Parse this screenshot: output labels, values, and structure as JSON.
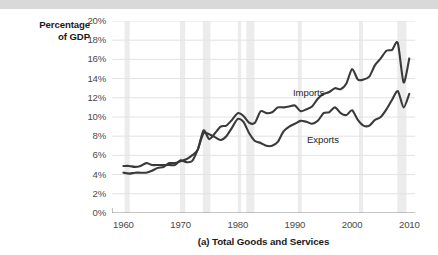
{
  "figure": {
    "caption": "(a) Total Goods and Services",
    "axis_title_line1": "Percentage",
    "axis_title_line2": "of GDP"
  },
  "colors": {
    "line": "#3a3a3a",
    "grid": "#e2e2e2",
    "recession_band": "#ececec",
    "axis": "#8a8a8a",
    "tick_text": "#4a4a4a",
    "title_text": "#1a1a1a",
    "top_strip": "#d9d9d9"
  },
  "chart_data": {
    "type": "line",
    "title": "(a) Total Goods and Services",
    "xlabel": "",
    "ylabel": "Percentage of GDP",
    "xlim": [
      1958,
      2011
    ],
    "ylim": [
      0,
      20
    ],
    "ytick_labels": [
      "20%",
      "18%",
      "16%",
      "14%",
      "12%",
      "10%",
      "8%",
      "6%",
      "4%",
      "2%",
      "0%"
    ],
    "ytick_values": [
      20,
      18,
      16,
      14,
      12,
      10,
      8,
      6,
      4,
      2,
      0
    ],
    "xtick_labels": [
      "1960",
      "1970",
      "1980",
      "1990",
      "2000",
      "2010"
    ],
    "xtick_values": [
      1960,
      1970,
      1980,
      1990,
      2000,
      2010
    ],
    "grid": true,
    "legend": "inline-labels",
    "recession_bands": [
      [
        1960.2,
        1961.1
      ],
      [
        1969.9,
        1970.8
      ],
      [
        1973.9,
        1975.2
      ],
      [
        1980.0,
        1980.6
      ],
      [
        1981.5,
        1982.9
      ],
      [
        1990.5,
        1991.2
      ],
      [
        2001.2,
        2001.9
      ],
      [
        2007.9,
        2009.5
      ]
    ],
    "series": [
      {
        "name": "Imports",
        "label": "Imports",
        "x": [
          1960,
          1961,
          1962,
          1963,
          1964,
          1965,
          1966,
          1967,
          1968,
          1969,
          1970,
          1971,
          1972,
          1973,
          1974,
          1975,
          1976,
          1977,
          1978,
          1979,
          1980,
          1981,
          1982,
          1983,
          1984,
          1985,
          1986,
          1987,
          1988,
          1989,
          1990,
          1991,
          1992,
          1993,
          1994,
          1995,
          1996,
          1997,
          1998,
          1999,
          2000,
          2001,
          2002,
          2003,
          2004,
          2005,
          2006,
          2007,
          2008,
          2009,
          2010
        ],
        "values": [
          4.2,
          4.1,
          4.2,
          4.2,
          4.2,
          4.4,
          4.7,
          4.8,
          5.2,
          5.2,
          5.4,
          5.6,
          6.0,
          6.6,
          8.6,
          7.7,
          8.3,
          9.0,
          9.1,
          9.7,
          10.4,
          10.1,
          9.4,
          9.4,
          10.6,
          10.4,
          10.5,
          11.0,
          11.0,
          11.1,
          11.2,
          10.6,
          10.8,
          11.1,
          11.9,
          12.4,
          12.6,
          13.0,
          12.9,
          13.5,
          15.0,
          13.9,
          13.9,
          14.2,
          15.4,
          16.1,
          16.9,
          17.0,
          17.7,
          13.6,
          16.1
        ]
      },
      {
        "name": "Exports",
        "label": "Exports",
        "x": [
          1960,
          1961,
          1962,
          1963,
          1964,
          1965,
          1966,
          1967,
          1968,
          1969,
          1970,
          1971,
          1972,
          1973,
          1974,
          1975,
          1976,
          1977,
          1978,
          1979,
          1980,
          1981,
          1982,
          1983,
          1984,
          1985,
          1986,
          1987,
          1988,
          1989,
          1990,
          1991,
          1992,
          1993,
          1994,
          1995,
          1996,
          1997,
          1998,
          1999,
          2000,
          2001,
          2002,
          2003,
          2004,
          2005,
          2006,
          2007,
          2008,
          2009,
          2010
        ],
        "values": [
          4.9,
          4.9,
          4.8,
          4.9,
          5.2,
          5.0,
          5.0,
          5.0,
          5.0,
          5.0,
          5.5,
          5.3,
          5.4,
          6.6,
          8.3,
          8.2,
          7.9,
          7.6,
          8.0,
          8.9,
          9.8,
          9.5,
          8.3,
          7.5,
          7.3,
          7.0,
          7.0,
          7.4,
          8.5,
          9.0,
          9.3,
          9.6,
          9.5,
          9.3,
          9.6,
          10.4,
          10.5,
          11.0,
          10.4,
          10.2,
          10.7,
          9.7,
          9.1,
          9.1,
          9.7,
          10.0,
          10.8,
          11.8,
          12.7,
          11.0,
          12.4
        ]
      }
    ]
  }
}
